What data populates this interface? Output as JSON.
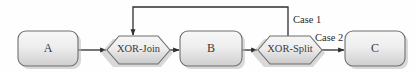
{
  "diagram": {
    "background_color": "#fefefe",
    "border_color": "#6e6e6e",
    "line_color": "#2e2e2e",
    "text_color": "#3a3a3a",
    "fill_top_color": "#f4f4f4",
    "fill_bottom_color": "#c9c9c9",
    "nodes": [
      {
        "id": "a",
        "label": "A",
        "type": "task",
        "x": 18,
        "y": 31,
        "w": 60,
        "h": 35
      },
      {
        "id": "xor-join",
        "label": "XOR-Join",
        "type": "gateway",
        "x": 107,
        "y": 36,
        "w": 63,
        "h": 28
      },
      {
        "id": "b",
        "label": "B",
        "type": "task",
        "x": 180,
        "y": 31,
        "w": 62,
        "h": 35
      },
      {
        "id": "xor-split",
        "label": "XOR-Split",
        "type": "gateway",
        "x": 258,
        "y": 36,
        "w": 64,
        "h": 28
      },
      {
        "id": "c",
        "label": "C",
        "type": "task",
        "x": 345,
        "y": 31,
        "w": 60,
        "h": 35
      }
    ],
    "edges": [
      {
        "id": "a-to-join",
        "from": "a",
        "to": "xor-join",
        "label": ""
      },
      {
        "id": "join-to-b",
        "from": "xor-join",
        "to": "b",
        "label": ""
      },
      {
        "id": "b-to-split",
        "from": "b",
        "to": "xor-split",
        "label": ""
      },
      {
        "id": "split-to-c",
        "from": "xor-split",
        "to": "c",
        "label": "Case 2"
      },
      {
        "id": "split-to-join",
        "from": "xor-split",
        "to": "xor-join",
        "label": "Case 1"
      }
    ],
    "edge_labels": {
      "case_1": "Case 1",
      "case_2": "Case 2"
    }
  }
}
